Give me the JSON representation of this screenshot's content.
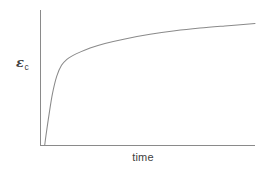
{
  "figure": {
    "name": "creep-strain-vs-time-schematic",
    "background_color": "#ffffff",
    "line_color": "#8a8a8a",
    "text_color": "#404040",
    "width": 260,
    "height": 172
  },
  "axes": {
    "y_axis": {
      "label_symbol": "ε",
      "label_subscript": "c",
      "label_full": "εc",
      "tick_labels": [],
      "has_ticks": false
    },
    "x_axis": {
      "label": "time",
      "tick_labels": [],
      "has_ticks": false
    },
    "origin_px": [
      40,
      145
    ],
    "x_axis_end_px": [
      255,
      145
    ],
    "y_axis_top_px": [
      40,
      10
    ]
  },
  "chart_data": {
    "type": "line",
    "title": "",
    "subtitle": "",
    "xlabel": "time",
    "ylabel": "εc",
    "grid": false,
    "legend": null,
    "legend_position": "none",
    "axis_ticks_shown": false,
    "xlim": [
      0,
      1
    ],
    "ylim": [
      0,
      1
    ],
    "annotations": [],
    "series": [
      {
        "name": "creep strain",
        "color": "#8a8a8a",
        "x": [
          0.022,
          0.03,
          0.042,
          0.058,
          0.078,
          0.1,
          0.125,
          0.152,
          0.186,
          0.233,
          0.302,
          0.395,
          0.512,
          0.628,
          0.744,
          0.86,
          1.0
        ],
        "y": [
          0.0,
          0.095,
          0.225,
          0.38,
          0.51,
          0.59,
          0.635,
          0.662,
          0.688,
          0.718,
          0.752,
          0.786,
          0.82,
          0.846,
          0.866,
          0.882,
          0.9
        ]
      }
    ]
  }
}
